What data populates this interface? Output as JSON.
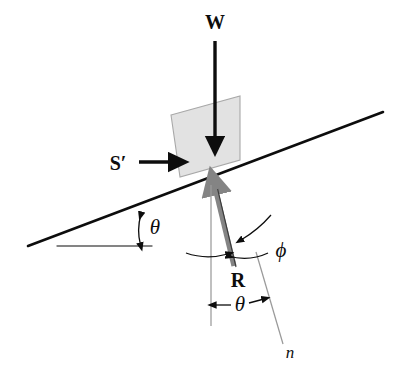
{
  "figure": {
    "type": "free-body-diagram",
    "background_color": "#ffffff",
    "ink_color": "#0d0d0d",
    "block_fill_color": "#e2e2e2",
    "block_stroke_color": "#9a9a9a",
    "reaction_arrow_color": "#848484",
    "thin_line_color": "#9a9a9a"
  },
  "labels": {
    "weight": "W",
    "applied_force": "S′",
    "reaction": "R",
    "normal": "n",
    "incline_angle": "θ",
    "normal_angle": "θ",
    "friction_angle": "ϕ"
  },
  "geometry": {
    "incline_start": [
      28,
      246
    ],
    "incline_end": [
      383,
      112
    ],
    "incline_angle_deg": 20.7,
    "horizontal_ref_start": [
      57,
      246
    ],
    "horizontal_ref_end": [
      152,
      246
    ],
    "block_corners": [
      [
        171,
        115
      ],
      [
        240,
        96
      ],
      [
        240,
        160
      ],
      [
        180,
        177
      ]
    ],
    "weight_arrow_from": [
      215,
      41
    ],
    "weight_arrow_to": [
      215,
      148
    ],
    "applied_arrow_from": [
      140,
      162
    ],
    "applied_arrow_to": [
      178,
      162
    ],
    "reaction_arrow_from": [
      234,
      266
    ],
    "reaction_arrow_to": [
      213,
      180
    ],
    "vertical_ref_from": [
      211,
      185
    ],
    "vertical_ref_to": [
      211,
      326
    ],
    "normal_line_from": [
      257,
      254
    ],
    "normal_line_to": [
      283,
      344
    ]
  }
}
